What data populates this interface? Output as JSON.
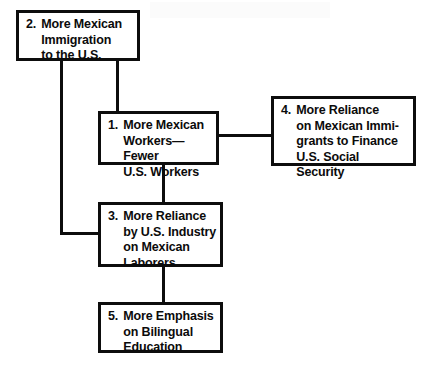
{
  "diagram": {
    "type": "flowchart",
    "background_color": "#ffffff",
    "line_color": "#0d0d0d",
    "text_color": "#0b0b0b",
    "nodes": [
      {
        "id": "node-2",
        "number": "2.",
        "text": "More Mexican\nImmigration\nto the U.S.",
        "x": 16,
        "y": 10,
        "width": 124,
        "height": 51
      },
      {
        "id": "node-1",
        "number": "1.",
        "text": "More Mexican\nWorkers—Fewer\nU.S. Workers",
        "x": 98,
        "y": 111,
        "width": 121,
        "height": 54
      },
      {
        "id": "node-4",
        "number": "4.",
        "text": "More Reliance\non Mexican Immi-\ngrants to Finance\nU.S. Social Security",
        "x": 271,
        "y": 96,
        "width": 145,
        "height": 70
      },
      {
        "id": "node-3",
        "number": "3.",
        "text": "More Reliance\nby U.S. Industry\non Mexican\nLaborers",
        "x": 98,
        "y": 202,
        "width": 125,
        "height": 65
      },
      {
        "id": "node-5",
        "number": "5.",
        "text": "More Emphasis\non Bilingual\nEducation",
        "x": 98,
        "y": 302,
        "width": 125,
        "height": 51
      }
    ],
    "connectors": [
      {
        "id": "connector-2-to-1-vertical",
        "x": 116,
        "y": 60,
        "width": 3,
        "height": 53
      },
      {
        "id": "connector-2-to-3-vertical",
        "x": 60,
        "y": 60,
        "width": 3,
        "height": 175
      },
      {
        "id": "connector-2-to-3-horizontal",
        "x": 60,
        "y": 232,
        "width": 42,
        "height": 3
      },
      {
        "id": "connector-1-to-4-horizontal",
        "x": 217,
        "y": 134,
        "width": 56,
        "height": 3
      },
      {
        "id": "connector-1-to-3-vertical",
        "x": 162,
        "y": 163,
        "width": 3,
        "height": 41
      },
      {
        "id": "connector-3-to-5-vertical",
        "x": 162,
        "y": 265,
        "width": 3,
        "height": 39
      }
    ]
  }
}
